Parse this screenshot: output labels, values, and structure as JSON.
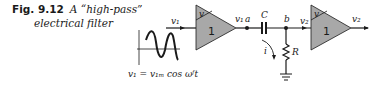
{
  "caption": {
    "figure_number": "Fig. 9.12",
    "title_line1": "A “high-pass”",
    "title_line2": "electrical filter"
  },
  "input_signal": {
    "label": "v₁",
    "equation": "v₁ = v₁ₘ cos ωᶠt"
  },
  "amplifier1": {
    "corner_label": "v",
    "gain": "1",
    "output_label": "v₁"
  },
  "nodes": {
    "a": "a",
    "b": "b"
  },
  "capacitor": {
    "label": "C"
  },
  "resistor": {
    "label": "R"
  },
  "current": {
    "label": "i"
  },
  "amplifier2": {
    "input_label": "v₂",
    "corner_label": "v",
    "gain": "1",
    "output_label": "v₂"
  },
  "colors": {
    "amplifier_fill": "#a8a8a8",
    "line": "#1a1a1a"
  }
}
